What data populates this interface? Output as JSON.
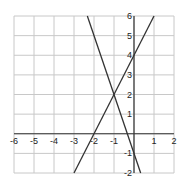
{
  "chart_data": {
    "type": "line",
    "title": "",
    "xlabel": "",
    "ylabel": "",
    "xlim": [
      -6,
      2
    ],
    "ylim": [
      -2,
      6
    ],
    "grid": true,
    "x_ticks": [
      -6,
      -5,
      -4,
      -3,
      -2,
      -1,
      1,
      2
    ],
    "y_ticks": [
      -2,
      -1,
      1,
      2,
      3,
      4,
      5,
      6
    ],
    "x_tick_labels": [
      "-6",
      "-5",
      "-4",
      "-3",
      "-2",
      "-1",
      "1",
      "2"
    ],
    "y_tick_labels": [
      "-2",
      "-1",
      "1",
      "2",
      "3",
      "4",
      "5",
      "6"
    ],
    "series": [
      {
        "name": "y = 2x + 4",
        "slope": 2,
        "intercept": 4,
        "points": [
          [
            -3,
            -2
          ],
          [
            1,
            6
          ]
        ]
      },
      {
        "name": "y = -3x - 1",
        "slope": -3,
        "intercept": -1,
        "points": [
          [
            -2.333,
            6
          ],
          [
            0.333,
            -2
          ]
        ]
      }
    ],
    "annotations": [
      {
        "label": "intersection",
        "x": -1,
        "y": 2
      }
    ],
    "colors": {
      "grid": "#c8c8c8",
      "axis": "#333333",
      "line": "#333333"
    }
  }
}
